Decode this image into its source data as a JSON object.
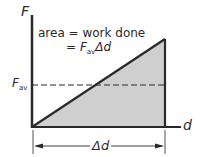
{
  "diagram": {
    "axes": {
      "y_label": "F",
      "x_label": "d"
    },
    "annotation": {
      "line1": "area = work done",
      "line2_prefix": "= ",
      "line2_F": "F",
      "line2_sub": "av",
      "line2_suffix": "Δd"
    },
    "average_force_label": {
      "symbol": "F",
      "subscript": "av"
    },
    "displacement_label": "Δd",
    "colors": {
      "fill": "#cfcfcf",
      "line": "#2a2a2a",
      "background": "#ffffff"
    },
    "shape": {
      "type": "triangle",
      "description": "Force increases linearly with displacement; shaded area under the line equals work done",
      "dashed_line": "average force F_av"
    }
  }
}
